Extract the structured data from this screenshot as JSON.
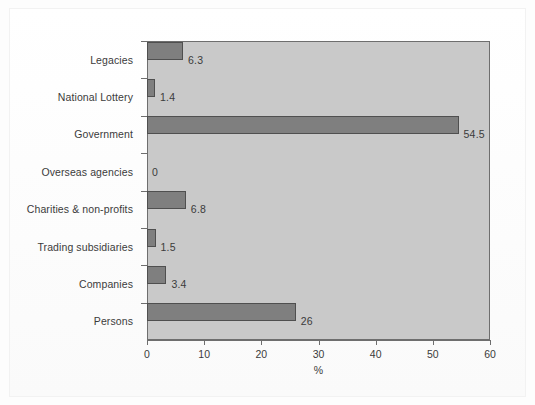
{
  "chart_data": {
    "type": "bar",
    "orientation": "horizontal",
    "title": "",
    "subtitle": "",
    "xlabel": "%",
    "ylabel": "",
    "categories": [
      "Legacies",
      "National Lottery",
      "Government",
      "Overseas agencies",
      "Charities & non-profits",
      "Trading subsidiaries",
      "Companies",
      "Persons"
    ],
    "values": [
      6.3,
      1.4,
      54.5,
      0,
      6.8,
      1.5,
      3.4,
      26
    ],
    "value_labels": [
      "6.3",
      "1.4",
      "54.5",
      "0",
      "6.8",
      "1.5",
      "3.4",
      "26"
    ],
    "xlim": [
      0,
      60
    ],
    "xticks": [
      0,
      10,
      20,
      30,
      40,
      50,
      60
    ],
    "xticklabels": [
      "0",
      "10",
      "20",
      "30",
      "40",
      "50",
      "60"
    ],
    "grid": false,
    "legend": false,
    "legend_position": "none",
    "colors": {
      "bar_fill": "#7f7f7f",
      "bar_edge": "#4f4f4f",
      "plot_background": "#c9c9c9",
      "plot_border": "#6e6e6e",
      "figure_background": "#fdfdfd",
      "text": "#3b3b3b"
    }
  }
}
